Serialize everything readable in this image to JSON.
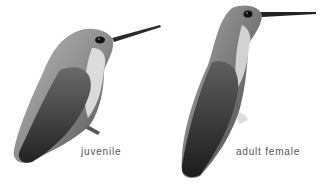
{
  "figures": [
    {
      "id": "juvenile",
      "caption": "juvenile"
    },
    {
      "id": "adult-female",
      "caption": "adult female"
    }
  ],
  "colors": {
    "background": "#ffffff",
    "caption": "#555555",
    "plumage_light": "#c8c8c8",
    "plumage_mid": "#8a8a8a",
    "plumage_dark": "#2e2e2e"
  }
}
